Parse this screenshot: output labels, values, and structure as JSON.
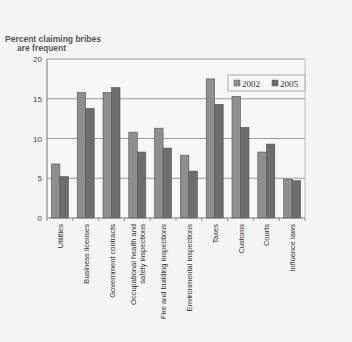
{
  "chart_data": {
    "type": "bar",
    "title": "",
    "ylabel": "Percent claiming bribes are frequent",
    "ylabel_lines": [
      "Percent claiming bribes",
      "are frequent"
    ],
    "xlabel": "",
    "ylim": [
      0,
      20
    ],
    "yticks": [
      0,
      5,
      10,
      15,
      20
    ],
    "grid": true,
    "legend_position": "upper right inside",
    "categories": [
      "Utilities",
      "Business licenses",
      "Government contracts",
      "Occupational health and safety inspections",
      "Fire and building inspections",
      "Environmental inspections",
      "Taxes",
      "Customs",
      "Courts",
      "Influence laws"
    ],
    "category_label_lines": [
      [
        "Utilities"
      ],
      [
        "Business licenses"
      ],
      [
        "Government contracts"
      ],
      [
        "Occupational health and",
        "safety inspections"
      ],
      [
        "Fire and building inspections"
      ],
      [
        "Environmental inspections"
      ],
      [
        "Taxes"
      ],
      [
        "Customs"
      ],
      [
        "Courts"
      ],
      [
        "Influence laws"
      ]
    ],
    "series": [
      {
        "name": "2002",
        "color": "#8f8f8f",
        "values": [
          6.8,
          15.8,
          15.8,
          10.8,
          11.3,
          7.9,
          17.5,
          15.3,
          8.3,
          4.9
        ]
      },
      {
        "name": "2005",
        "color": "#6d6d6d",
        "values": [
          5.2,
          13.8,
          16.4,
          8.3,
          8.8,
          5.9,
          14.3,
          11.4,
          9.3,
          4.7
        ]
      }
    ]
  },
  "colors": {
    "background": "#f5f5f5",
    "plot_background": "#f7f7f7",
    "gridline": "#9a9a9a",
    "bar_outline": "#555555",
    "axis": "#777777"
  }
}
